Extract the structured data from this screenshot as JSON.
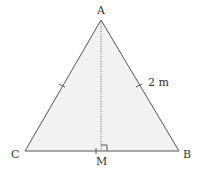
{
  "diagram": {
    "type": "geometry-figure",
    "colors": {
      "stroke": "#555555",
      "fill": "#f2f2f2",
      "text": "#333333"
    },
    "points": {
      "A": {
        "label": "A",
        "x": 101,
        "y": 20
      },
      "B": {
        "label": "B",
        "x": 179,
        "y": 151
      },
      "C": {
        "label": "C",
        "x": 25,
        "y": 151
      },
      "M": {
        "label": "M",
        "x": 101,
        "y": 151
      }
    },
    "segments": [
      {
        "from": "A",
        "to": "B",
        "style": "solid",
        "tick": true
      },
      {
        "from": "A",
        "to": "C",
        "style": "solid",
        "tick": true
      },
      {
        "from": "C",
        "to": "B",
        "style": "solid"
      },
      {
        "from": "A",
        "to": "M",
        "style": "dotted"
      }
    ],
    "annotations": {
      "side_length": "2 m",
      "right_angle_at": "M"
    }
  }
}
